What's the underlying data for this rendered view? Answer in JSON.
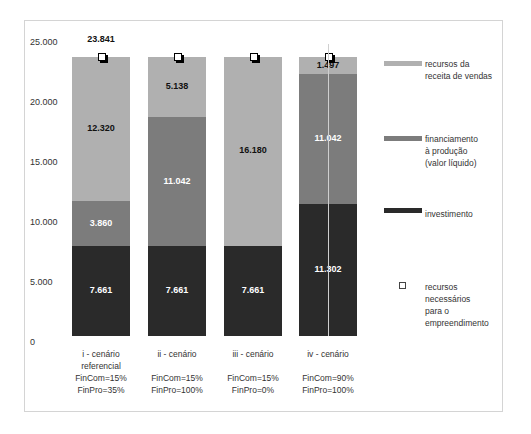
{
  "chart_data": {
    "type": "bar",
    "stacked": true,
    "title": "",
    "xlabel": "",
    "ylabel": "",
    "ylim": [
      0,
      25000
    ],
    "yticks": [
      "0",
      "5.000",
      "10.000",
      "15.000",
      "20.000",
      "25.000"
    ],
    "grid": false,
    "legend_position": "right",
    "categories": [
      "i - cenário referencial FinCom=15% FinPro=35%",
      "ii - cenário FinCom=15% FinPro=100%",
      "iii - cenário FinCom=15% FinPro=0%",
      "iv - cenário FinCom=90% FinPro=100%"
    ],
    "series": [
      {
        "name": "investimento",
        "color": "#2a2a2a",
        "values": [
          7661,
          7661,
          7661,
          11302
        ]
      },
      {
        "name": "financiamento à produção (valor líquido)",
        "color": "#7c7c7c",
        "values": [
          3860,
          11042,
          0,
          11042
        ]
      },
      {
        "name": "recursos da receita de vendas",
        "color": "#b0b0b0",
        "values": [
          12320,
          5138,
          16180,
          1497
        ]
      },
      {
        "name": "recursos necessários para o empreendimento",
        "type": "marker",
        "values": [
          23841,
          23841,
          23841,
          23841
        ]
      }
    ],
    "annotations": [
      "23.841"
    ]
  },
  "axis": {
    "ticks": [
      {
        "label": "25.000",
        "top": 37
      },
      {
        "label": "20.000",
        "top": 97
      },
      {
        "label": "15.000",
        "top": 157
      },
      {
        "label": "10.000",
        "top": 217
      },
      {
        "label": "5.000",
        "top": 277
      },
      {
        "label": "0",
        "top": 337
      }
    ]
  },
  "bars": [
    {
      "left": 72,
      "label_lines": [
        "i - cenário",
        "referencial",
        "FinCom=15%",
        "FinPro=35%"
      ],
      "segs": [
        {
          "bottom": 0,
          "value": 7661,
          "label": "7.661",
          "color": "#2a2a2a",
          "text": "#ffffff"
        },
        {
          "bottom": 7661,
          "value": 3860,
          "label": "3.860",
          "color": "#7c7c7c",
          "text": "#ffffff"
        },
        {
          "bottom": 11521,
          "value": 12320,
          "label": "12.320",
          "color": "#b0b0b0",
          "text": "#111111"
        }
      ]
    },
    {
      "left": 148,
      "label_lines": [
        "ii - cenário",
        "",
        "FinCom=15%",
        "FinPro=100%"
      ],
      "segs": [
        {
          "bottom": 0,
          "value": 7661,
          "label": "7.661",
          "color": "#2a2a2a",
          "text": "#ffffff"
        },
        {
          "bottom": 7661,
          "value": 11042,
          "label": "11.042",
          "color": "#7c7c7c",
          "text": "#ffffff"
        },
        {
          "bottom": 18703,
          "value": 5138,
          "label": "5.138",
          "color": "#b0b0b0",
          "text": "#111111"
        }
      ]
    },
    {
      "left": 224,
      "label_lines": [
        "iii - cenário",
        "",
        "FinCom=15%",
        "FinPro=0%"
      ],
      "segs": [
        {
          "bottom": 0,
          "value": 7661,
          "label": "7.661",
          "color": "#2a2a2a",
          "text": "#ffffff"
        },
        {
          "bottom": 7661,
          "value": 16180,
          "label": "16.180",
          "color": "#b0b0b0",
          "text": "#111111"
        }
      ]
    },
    {
      "left": 299,
      "label_lines": [
        "iv - cenário",
        "",
        "FinCom=90%",
        "FinPro=100%"
      ],
      "segs": [
        {
          "bottom": 0,
          "value": 11302,
          "label": "11.302",
          "color": "#2a2a2a",
          "text": "#ffffff"
        },
        {
          "bottom": 11302,
          "value": 11042,
          "label": "11.042",
          "color": "#7c7c7c",
          "text": "#ffffff"
        },
        {
          "bottom": 22344,
          "value": 1497,
          "label": "1.497",
          "color": "#b0b0b0",
          "text": "#111111"
        }
      ]
    }
  ],
  "total_label": "23.841",
  "legend": {
    "items": [
      {
        "label": "recursos da receita de vendas",
        "lines": [
          "recursos da",
          "receita de vendas"
        ],
        "color": "#b0b0b0",
        "swatch_top": 61,
        "text_top": 58
      },
      {
        "label": "financiamento à produção (valor líquido)",
        "lines": [
          "financiamento",
          "à produção",
          "(valor líquido)"
        ],
        "color": "#7c7c7c",
        "swatch_top": 136,
        "text_top": 133
      },
      {
        "label": "investimento",
        "lines": [
          "investimento"
        ],
        "color": "#2a2a2a",
        "swatch_top": 208,
        "text_top": 208
      },
      {
        "label": "recursos necessários para o empreendimento",
        "lines": [
          "recursos",
          "necessários",
          "para o",
          "empreendimento"
        ],
        "text_top": 281
      }
    ]
  }
}
